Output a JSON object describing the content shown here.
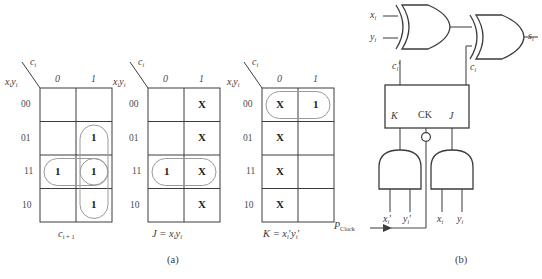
{
  "figure": {
    "panel_a_label": "(a)",
    "panel_b_label": "(b)"
  },
  "kmaps": [
    {
      "id": "kmap-carry",
      "col_var": "c",
      "col_var_sub": "i",
      "row_var_1": "x",
      "row_var_1_sub": "i",
      "row_var_2": "y",
      "row_var_2_sub": "i",
      "col_headers": [
        "0",
        "1"
      ],
      "row_headers": [
        "00",
        "01",
        "11",
        "10"
      ],
      "cells": [
        [
          "",
          ""
        ],
        [
          "",
          "1"
        ],
        [
          "1",
          "1"
        ],
        [
          "",
          "1"
        ]
      ],
      "caption_main": "c",
      "caption_sub": "i + 1",
      "caption_rhs": "",
      "groups": [
        {
          "name": "group-col1-rows-01-11",
          "col": 1,
          "row_start": 1,
          "row_end": 2
        },
        {
          "name": "group-row-11-both-cols",
          "row": 2,
          "col_start": 0,
          "col_end": 1
        },
        {
          "name": "group-col1-rows-11-10",
          "col": 1,
          "row_start": 2,
          "row_end": 3
        }
      ]
    },
    {
      "id": "kmap-j",
      "col_var": "c",
      "col_var_sub": "i",
      "row_var_1": "x",
      "row_var_1_sub": "i",
      "row_var_2": "y",
      "row_var_2_sub": "i",
      "col_headers": [
        "0",
        "1"
      ],
      "row_headers": [
        "00",
        "01",
        "11",
        "10"
      ],
      "cells": [
        [
          "",
          "X"
        ],
        [
          "",
          "X"
        ],
        [
          "1",
          "X"
        ],
        [
          "",
          "X"
        ]
      ],
      "caption_main": "J = x",
      "caption_sub": "i",
      "caption_rhs": "y",
      "caption_rhs_sub": "i",
      "groups": [
        {
          "name": "group-row-11-both-cols",
          "row": 2,
          "col_start": 0,
          "col_end": 1
        }
      ]
    },
    {
      "id": "kmap-k",
      "col_var": "c",
      "col_var_sub": "i",
      "row_var_1": "x",
      "row_var_1_sub": "i",
      "row_var_2": "y",
      "row_var_2_sub": "i",
      "col_headers": [
        "0",
        "1"
      ],
      "row_headers": [
        "00",
        "01",
        "11",
        "10"
      ],
      "cells": [
        [
          "X",
          "1"
        ],
        [
          "X",
          ""
        ],
        [
          "X",
          ""
        ],
        [
          "X",
          ""
        ]
      ],
      "caption_main": "K = x",
      "caption_sub": "i",
      "caption_prime": "′",
      "caption_rhs": "y",
      "caption_rhs_sub": "i",
      "caption_rhs_prime": "′",
      "groups": [
        {
          "name": "group-row-00-both-cols",
          "row": 0,
          "col_start": 0,
          "col_end": 1
        }
      ]
    }
  ],
  "circuit": {
    "inputs": {
      "x_label": "x",
      "x_sub": "i",
      "y_label": "y",
      "y_sub": "i"
    },
    "output": {
      "s_label": "s",
      "s_sub": "i"
    },
    "xor_gate_1": "XOR",
    "xor_gate_2": "XOR",
    "flipflop": {
      "k_label": "K",
      "ck_label": "CK",
      "j_label": "J",
      "out_q_prime": "c",
      "out_q_prime_sub": "i",
      "out_q_prime_mark": "′",
      "out_q": "c",
      "out_q_sub": "i"
    },
    "and_gate_left": {
      "in1": "x",
      "in1_sub": "i",
      "in1_prime": "′",
      "in2": "y",
      "in2_sub": "i",
      "in2_prime": "′"
    },
    "and_gate_right": {
      "in1": "x",
      "in1_sub": "i",
      "in2": "y",
      "in2_sub": "i"
    },
    "clock": {
      "label_main": "P",
      "label_sub": "Clock"
    }
  },
  "colors": {
    "grid_line": "#3c3c3c",
    "group_oval": "#8a8a8a",
    "text": "#3a3a3a",
    "value_text": "#1c1c1c",
    "wire": "#4a4a4a"
  }
}
